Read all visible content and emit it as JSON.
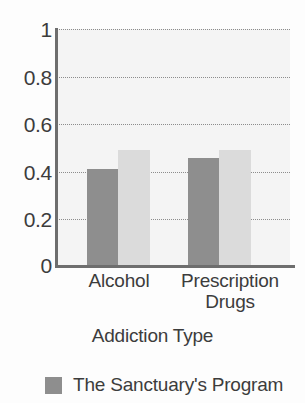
{
  "chart_data": {
    "type": "bar",
    "title": "",
    "subtitle": "",
    "xlabel": "Addiction Type",
    "ylabel": "",
    "categories": [
      "Alcohol",
      "Prescription Drugs"
    ],
    "series": [
      {
        "name": "The Sanctuary's Program",
        "color": "#8e8e8e",
        "values": [
          0.41,
          0.46
        ]
      },
      {
        "name": "",
        "color": "#dbdbdb",
        "values": [
          0.49,
          0.49
        ]
      }
    ],
    "ylim": [
      0,
      1
    ],
    "yticks": [
      1,
      0.8,
      0.6,
      0.4,
      0.2,
      0
    ],
    "ytick_labels": [
      "1",
      "0.8",
      "0.6",
      "0.4",
      "0.2",
      "0"
    ],
    "grid": true,
    "grid_style": "dotted-horizontal",
    "legend_position": "bottom-left",
    "legend": [
      {
        "label": "The Sanctuary's Program",
        "color": "#8e8e8e"
      }
    ],
    "plot_background": "#f4f4f4",
    "axis_color": "#6e6e6e"
  },
  "axis": {
    "y_tick_labels": [
      "1",
      "0.8",
      "0.6",
      "0.4",
      "0.2",
      "0"
    ],
    "x_title": "Addiction Type",
    "category_labels": [
      "Alcohol",
      "Prescription Drugs"
    ]
  },
  "legend": {
    "entries": [
      {
        "label": "The Sanctuary's Program",
        "color": "#8e8e8e"
      }
    ]
  }
}
